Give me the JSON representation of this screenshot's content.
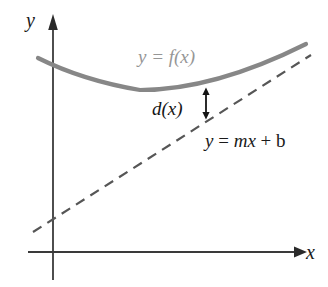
{
  "figure": {
    "background_color": "#ffffff"
  },
  "axes": {
    "x_label": "x",
    "y_label": "y",
    "axis_color": "#3a3a3a",
    "origin": {
      "x": 53,
      "y": 252
    },
    "x_axis": {
      "start_x": 28,
      "end_x": 300,
      "y": 252,
      "arrow": "right"
    },
    "y_axis": {
      "x": 53,
      "start_y": 280,
      "end_y": 18,
      "arrow": "up"
    }
  },
  "curve": {
    "label": "y = f(x)",
    "color": "#878787",
    "stroke_width": 4,
    "description": "upward-opening parabola-like curve with minimum near x=140",
    "points": [
      {
        "x": 38,
        "y": 58
      },
      {
        "x": 70,
        "y": 72
      },
      {
        "x": 105,
        "y": 84
      },
      {
        "x": 140,
        "y": 90
      },
      {
        "x": 175,
        "y": 88
      },
      {
        "x": 210,
        "y": 80
      },
      {
        "x": 245,
        "y": 68
      },
      {
        "x": 280,
        "y": 55
      },
      {
        "x": 305,
        "y": 45
      }
    ]
  },
  "line": {
    "label": "y = mx + b",
    "label_parts": {
      "y": "y",
      "eq": " = ",
      "m": "m",
      "x": "x",
      "plus": " + ",
      "b": "b"
    },
    "color": "#565656",
    "stroke_width": 2,
    "dash_pattern": "10 7",
    "start": {
      "x": 33,
      "y": 232
    },
    "end": {
      "x": 311,
      "y": 55
    }
  },
  "distance": {
    "label": "d(x)",
    "color": "#151515",
    "arrow_x": 206,
    "arrow_top_y": 90,
    "arrow_bottom_y": 117,
    "arrow_heads": "both"
  }
}
